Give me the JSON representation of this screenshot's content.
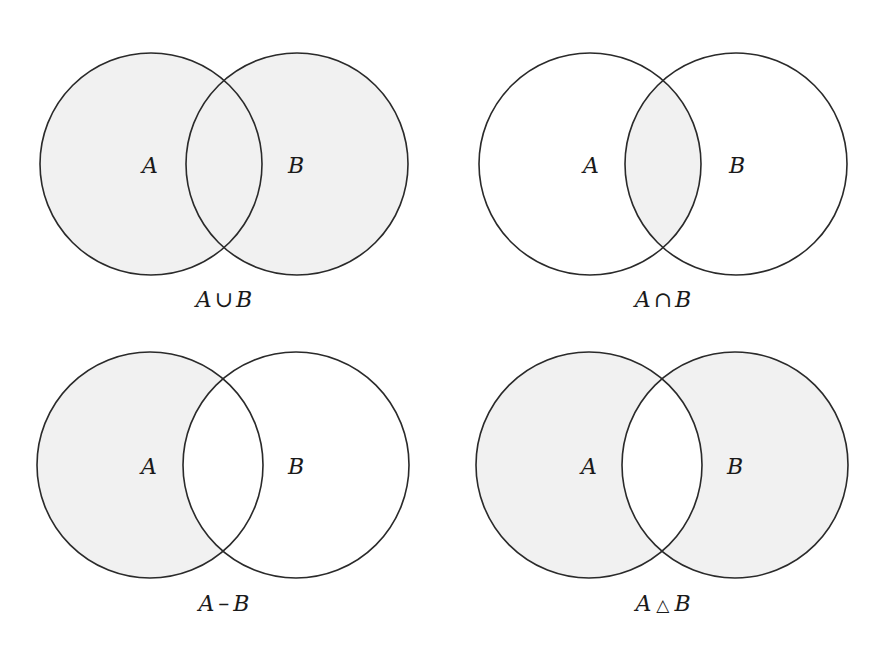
{
  "figure": {
    "fill_color": "#f1f1f1",
    "stroke_color": "#2a2a2a",
    "background": "#ffffff"
  },
  "panels": [
    {
      "id": "union",
      "caption": {
        "left": "A",
        "op": "∪",
        "right": "B"
      },
      "labels": {
        "a": "A",
        "b": "B"
      },
      "shaded_regions": [
        "A-only",
        "intersection",
        "B-only"
      ]
    },
    {
      "id": "intersection",
      "caption": {
        "left": "A",
        "op": "∩",
        "right": "B"
      },
      "labels": {
        "a": "A",
        "b": "B"
      },
      "shaded_regions": [
        "intersection"
      ]
    },
    {
      "id": "difference",
      "caption": {
        "left": "A",
        "op": "–",
        "right": "B"
      },
      "labels": {
        "a": "A",
        "b": "B"
      },
      "shaded_regions": [
        "A-only"
      ]
    },
    {
      "id": "symmetric-difference",
      "caption": {
        "left": "A",
        "op": "△",
        "right": "B"
      },
      "labels": {
        "a": "A",
        "b": "B"
      },
      "shaded_regions": [
        "A-only",
        "B-only"
      ]
    }
  ]
}
